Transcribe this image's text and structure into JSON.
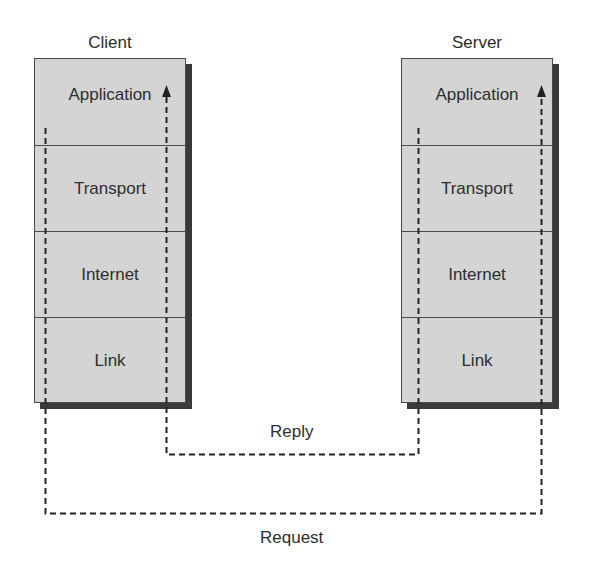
{
  "diagram": {
    "type": "protocol-stack-communication",
    "client": {
      "title": "Client",
      "layers": [
        "Application",
        "Transport",
        "Internet",
        "Link"
      ]
    },
    "server": {
      "title": "Server",
      "layers": [
        "Application",
        "Transport",
        "Internet",
        "Link"
      ]
    },
    "flows": {
      "reply_label": "Reply",
      "request_label": "Request"
    },
    "colors": {
      "layer_fill": "#d4d4d4",
      "border": "#4a4a4a",
      "shadow": "#3a3a3a",
      "dashed_line": "#222222"
    }
  }
}
